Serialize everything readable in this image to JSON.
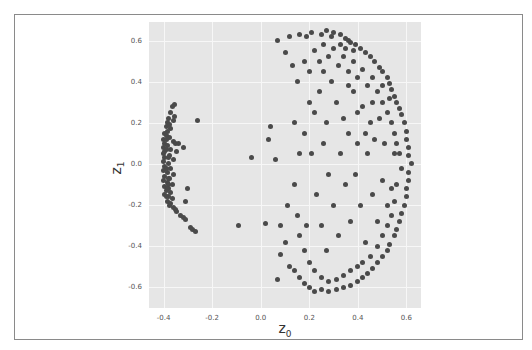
{
  "chart_data": {
    "type": "scatter",
    "title": "",
    "xlabel": "z",
    "xlabel_sub": "0",
    "ylabel": "z",
    "ylabel_sub": "1",
    "xlim": [
      -0.46,
      0.66
    ],
    "ylim": [
      -0.7,
      0.69
    ],
    "xticks": [
      "-0.4",
      "-0.2",
      "0.0",
      "0.2",
      "0.4",
      "0.6"
    ],
    "xtick_values": [
      -0.4,
      -0.2,
      0.0,
      0.2,
      0.4,
      0.6
    ],
    "yticks": [
      "0.6",
      "0.4",
      "0.2",
      "0.0",
      "-0.2",
      "-0.4",
      "-0.6"
    ],
    "ytick_values": [
      0.6,
      0.4,
      0.2,
      0.0,
      -0.2,
      -0.4,
      -0.6
    ],
    "grid": true,
    "legend": null,
    "marker_color": "#4a4a4a",
    "background_color": "#e6e6e6",
    "series": [
      {
        "name": "left-cluster",
        "description": "Dense vertical band near z0≈-0.39 spanning z1 from about -0.33 to 0.29",
        "points": [
          [
            -0.355,
            0.29
          ],
          [
            -0.365,
            0.28
          ],
          [
            -0.37,
            0.25
          ],
          [
            -0.355,
            0.23
          ],
          [
            -0.38,
            0.22
          ],
          [
            -0.36,
            0.21
          ],
          [
            -0.385,
            0.2
          ],
          [
            -0.39,
            0.18
          ],
          [
            -0.37,
            0.17
          ],
          [
            -0.395,
            0.15
          ],
          [
            -0.39,
            0.14
          ],
          [
            -0.375,
            0.13
          ],
          [
            -0.4,
            0.12
          ],
          [
            -0.36,
            0.11
          ],
          [
            -0.395,
            0.1
          ],
          [
            -0.385,
            0.09
          ],
          [
            -0.35,
            0.1
          ],
          [
            -0.34,
            0.1
          ],
          [
            -0.4,
            0.08
          ],
          [
            -0.37,
            0.07
          ],
          [
            -0.395,
            0.06
          ],
          [
            -0.345,
            0.06
          ],
          [
            -0.4,
            0.05
          ],
          [
            -0.375,
            0.04
          ],
          [
            -0.395,
            0.03
          ],
          [
            -0.36,
            0.02
          ],
          [
            -0.4,
            0.01
          ],
          [
            -0.38,
            0.0
          ],
          [
            -0.395,
            -0.01
          ],
          [
            -0.37,
            -0.02
          ],
          [
            -0.4,
            -0.03
          ],
          [
            -0.385,
            -0.04
          ],
          [
            -0.36,
            -0.05
          ],
          [
            -0.395,
            -0.06
          ],
          [
            -0.375,
            -0.07
          ],
          [
            -0.4,
            -0.08
          ],
          [
            -0.385,
            -0.09
          ],
          [
            -0.365,
            -0.1
          ],
          [
            -0.395,
            -0.11
          ],
          [
            -0.38,
            -0.12
          ],
          [
            -0.39,
            -0.13
          ],
          [
            -0.37,
            -0.14
          ],
          [
            -0.395,
            -0.15
          ],
          [
            -0.38,
            -0.16
          ],
          [
            -0.365,
            -0.17
          ],
          [
            -0.385,
            -0.18
          ],
          [
            -0.37,
            -0.19
          ],
          [
            -0.375,
            -0.2
          ],
          [
            -0.36,
            -0.21
          ],
          [
            -0.35,
            -0.22
          ],
          [
            -0.345,
            -0.23
          ],
          [
            -0.33,
            -0.25
          ],
          [
            -0.32,
            -0.26
          ],
          [
            -0.31,
            -0.27
          ],
          [
            -0.29,
            -0.31
          ],
          [
            -0.28,
            -0.32
          ],
          [
            -0.27,
            -0.33
          ],
          [
            -0.3,
            -0.12
          ],
          [
            -0.31,
            -0.18
          ],
          [
            -0.32,
            0.08
          ],
          [
            -0.385,
            0.16
          ],
          [
            -0.39,
            0.12
          ],
          [
            -0.38,
            0.03
          ],
          [
            -0.39,
            -0.02
          ],
          [
            -0.38,
            -0.1
          ],
          [
            -0.39,
            -0.16
          ],
          [
            -0.375,
            0.19
          ],
          [
            -0.38,
            -0.07
          ],
          [
            -0.39,
            0.07
          ],
          [
            -0.385,
            -0.12
          ]
        ]
      },
      {
        "name": "isolated",
        "points": [
          [
            -0.26,
            0.21
          ],
          [
            -0.04,
            0.03
          ],
          [
            -0.09,
            -0.3
          ],
          [
            0.02,
            -0.29
          ],
          [
            0.08,
            -0.3
          ],
          [
            0.04,
            0.18
          ],
          [
            0.03,
            0.12
          ],
          [
            0.06,
            0.02
          ],
          [
            0.07,
            -0.56
          ]
        ]
      },
      {
        "name": "right-cluster",
        "description": "Crescent-shaped spread with z0 from about 0.05 to 0.62 and z1 from -0.62 to 0.65, densest along outer arc",
        "points": [
          [
            0.07,
            0.6
          ],
          [
            0.12,
            0.62
          ],
          [
            0.16,
            0.63
          ],
          [
            0.19,
            0.62
          ],
          [
            0.21,
            0.64
          ],
          [
            0.25,
            0.63
          ],
          [
            0.27,
            0.65
          ],
          [
            0.3,
            0.64
          ],
          [
            0.33,
            0.63
          ],
          [
            0.35,
            0.61
          ],
          [
            0.36,
            0.6
          ],
          [
            0.37,
            0.59
          ],
          [
            0.39,
            0.58
          ],
          [
            0.41,
            0.56
          ],
          [
            0.43,
            0.54
          ],
          [
            0.45,
            0.52
          ],
          [
            0.47,
            0.5
          ],
          [
            0.49,
            0.47
          ],
          [
            0.5,
            0.45
          ],
          [
            0.52,
            0.42
          ],
          [
            0.53,
            0.39
          ],
          [
            0.54,
            0.36
          ],
          [
            0.55,
            0.33
          ],
          [
            0.56,
            0.3
          ],
          [
            0.57,
            0.27
          ],
          [
            0.58,
            0.24
          ],
          [
            0.59,
            0.2
          ],
          [
            0.6,
            0.16
          ],
          [
            0.6,
            0.12
          ],
          [
            0.61,
            0.08
          ],
          [
            0.61,
            0.04
          ],
          [
            0.62,
            0.0
          ],
          [
            0.61,
            -0.04
          ],
          [
            0.61,
            -0.08
          ],
          [
            0.6,
            -0.12
          ],
          [
            0.6,
            -0.16
          ],
          [
            0.59,
            -0.2
          ],
          [
            0.58,
            -0.24
          ],
          [
            0.57,
            -0.28
          ],
          [
            0.56,
            -0.32
          ],
          [
            0.55,
            -0.35
          ],
          [
            0.53,
            -0.39
          ],
          [
            0.52,
            -0.42
          ],
          [
            0.5,
            -0.45
          ],
          [
            0.48,
            -0.48
          ],
          [
            0.46,
            -0.51
          ],
          [
            0.44,
            -0.53
          ],
          [
            0.42,
            -0.55
          ],
          [
            0.4,
            -0.57
          ],
          [
            0.37,
            -0.59
          ],
          [
            0.34,
            -0.6
          ],
          [
            0.31,
            -0.61
          ],
          [
            0.28,
            -0.62
          ],
          [
            0.25,
            -0.61
          ],
          [
            0.22,
            -0.62
          ],
          [
            0.2,
            -0.6
          ],
          [
            0.18,
            -0.58
          ],
          [
            0.16,
            -0.55
          ],
          [
            0.14,
            -0.52
          ],
          [
            0.12,
            -0.5
          ],
          [
            0.1,
            -0.38
          ],
          [
            0.08,
            -0.44
          ],
          [
            0.11,
            -0.2
          ],
          [
            0.14,
            0.2
          ],
          [
            0.13,
            0.48
          ],
          [
            0.1,
            0.54
          ],
          [
            0.15,
            0.4
          ],
          [
            0.18,
            0.5
          ],
          [
            0.2,
            0.45
          ],
          [
            0.22,
            0.55
          ],
          [
            0.24,
            0.5
          ],
          [
            0.26,
            0.58
          ],
          [
            0.28,
            0.52
          ],
          [
            0.3,
            0.56
          ],
          [
            0.32,
            0.48
          ],
          [
            0.34,
            0.52
          ],
          [
            0.36,
            0.45
          ],
          [
            0.38,
            0.5
          ],
          [
            0.4,
            0.42
          ],
          [
            0.42,
            0.46
          ],
          [
            0.44,
            0.38
          ],
          [
            0.46,
            0.42
          ],
          [
            0.48,
            0.35
          ],
          [
            0.5,
            0.3
          ],
          [
            0.52,
            0.25
          ],
          [
            0.54,
            0.2
          ],
          [
            0.55,
            0.15
          ],
          [
            0.56,
            0.1
          ],
          [
            0.57,
            0.05
          ],
          [
            0.58,
            -0.02
          ],
          [
            0.56,
            -0.1
          ],
          [
            0.55,
            -0.18
          ],
          [
            0.54,
            -0.25
          ],
          [
            0.52,
            -0.3
          ],
          [
            0.5,
            -0.35
          ],
          [
            0.48,
            -0.4
          ],
          [
            0.45,
            -0.45
          ],
          [
            0.42,
            -0.48
          ],
          [
            0.4,
            -0.5
          ],
          [
            0.37,
            -0.52
          ],
          [
            0.34,
            -0.54
          ],
          [
            0.31,
            -0.56
          ],
          [
            0.28,
            -0.57
          ],
          [
            0.25,
            -0.55
          ],
          [
            0.22,
            -0.52
          ],
          [
            0.2,
            -0.48
          ],
          [
            0.18,
            -0.42
          ],
          [
            0.16,
            -0.35
          ],
          [
            0.15,
            -0.25
          ],
          [
            0.14,
            -0.1
          ],
          [
            0.16,
            0.05
          ],
          [
            0.18,
            0.15
          ],
          [
            0.2,
            0.3
          ],
          [
            0.22,
            0.25
          ],
          [
            0.24,
            0.35
          ],
          [
            0.26,
            0.1
          ],
          [
            0.27,
            0.2
          ],
          [
            0.28,
            -0.05
          ],
          [
            0.29,
            0.4
          ],
          [
            0.3,
            -0.2
          ],
          [
            0.31,
            0.3
          ],
          [
            0.32,
            -0.35
          ],
          [
            0.33,
            0.05
          ],
          [
            0.34,
            0.22
          ],
          [
            0.35,
            -0.1
          ],
          [
            0.36,
            0.15
          ],
          [
            0.37,
            -0.28
          ],
          [
            0.38,
            0.35
          ],
          [
            0.39,
            -0.05
          ],
          [
            0.4,
            0.1
          ],
          [
            0.41,
            -0.2
          ],
          [
            0.42,
            0.28
          ],
          [
            0.43,
            -0.38
          ],
          [
            0.44,
            0.05
          ],
          [
            0.45,
            0.2
          ],
          [
            0.46,
            -0.15
          ],
          [
            0.47,
            0.12
          ],
          [
            0.48,
            -0.28
          ],
          [
            0.49,
            0.22
          ],
          [
            0.5,
            -0.08
          ],
          [
            0.51,
            0.1
          ],
          [
            0.52,
            -0.2
          ],
          [
            0.53,
            0.32
          ],
          [
            0.54,
            -0.12
          ],
          [
            0.55,
            0.05
          ],
          [
            0.25,
            -0.3
          ],
          [
            0.27,
            -0.42
          ],
          [
            0.23,
            -0.15
          ],
          [
            0.21,
            0.05
          ],
          [
            0.19,
            -0.3
          ],
          [
            0.26,
            0.45
          ],
          [
            0.29,
            0.62
          ],
          [
            0.33,
            0.58
          ],
          [
            0.35,
            0.56
          ],
          [
            0.38,
            0.55
          ],
          [
            0.36,
            0.38
          ],
          [
            0.4,
            0.25
          ],
          [
            0.43,
            0.15
          ],
          [
            0.46,
            0.3
          ],
          [
            0.5,
            0.38
          ]
        ]
      }
    ]
  }
}
